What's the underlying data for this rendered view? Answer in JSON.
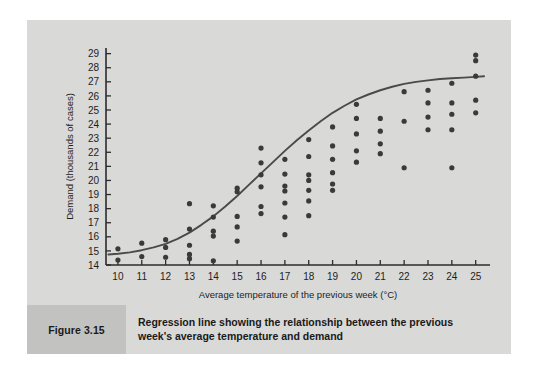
{
  "figure": {
    "number_label": "Figure 3.15",
    "caption": "Regression line showing the relationship between the previous week's average temperature and demand"
  },
  "colors": {
    "page_background": "#ffffff",
    "panel_background": "#d9d9d7",
    "caption_band": "#c2c2c0",
    "point_color": "#3a3a3a",
    "line_color": "#4a4a4a",
    "axis_color": "#2b2b2b",
    "text_color": "#1a1a1a"
  },
  "chart_data": {
    "type": "scatter",
    "title": "",
    "xlabel": "Average temperature of the previous week (°C)",
    "ylabel": "Demand (thousands of cases)",
    "xlim": [
      9.5,
      25.6
    ],
    "ylim": [
      14,
      29.4
    ],
    "xticks": [
      10,
      11,
      12,
      13,
      14,
      15,
      16,
      17,
      18,
      19,
      20,
      21,
      22,
      23,
      24,
      25
    ],
    "yticks": [
      14,
      15,
      16,
      17,
      18,
      19,
      20,
      21,
      22,
      23,
      24,
      25,
      26,
      27,
      28,
      29
    ],
    "grid": false,
    "legend": false,
    "series": [
      {
        "name": "Observations",
        "type": "scatter",
        "points": [
          [
            10,
            15.15
          ],
          [
            10,
            14.35
          ],
          [
            11,
            15.55
          ],
          [
            11,
            14.6
          ],
          [
            12,
            15.8
          ],
          [
            12,
            15.25
          ],
          [
            12,
            14.55
          ],
          [
            13,
            18.35
          ],
          [
            13,
            16.55
          ],
          [
            13,
            15.4
          ],
          [
            13,
            14.75
          ],
          [
            13,
            14.45
          ],
          [
            14,
            18.2
          ],
          [
            14,
            17.4
          ],
          [
            14,
            16.4
          ],
          [
            14,
            16.05
          ],
          [
            14,
            14.3
          ],
          [
            15,
            19.45
          ],
          [
            15,
            19.2
          ],
          [
            15,
            17.45
          ],
          [
            15,
            16.7
          ],
          [
            15,
            15.7
          ],
          [
            16,
            22.3
          ],
          [
            16,
            21.25
          ],
          [
            16,
            20.4
          ],
          [
            16,
            19.55
          ],
          [
            16,
            18.15
          ],
          [
            16,
            17.65
          ],
          [
            17,
            21.5
          ],
          [
            17,
            20.45
          ],
          [
            17,
            19.6
          ],
          [
            17,
            19.25
          ],
          [
            17,
            18.4
          ],
          [
            17,
            17.4
          ],
          [
            17,
            16.15
          ],
          [
            18,
            22.9
          ],
          [
            18,
            21.7
          ],
          [
            18,
            20.4
          ],
          [
            18,
            20.0
          ],
          [
            18,
            19.3
          ],
          [
            18,
            18.55
          ],
          [
            18,
            17.5
          ],
          [
            19,
            23.8
          ],
          [
            19,
            22.45
          ],
          [
            19,
            21.5
          ],
          [
            19,
            20.55
          ],
          [
            19,
            19.75
          ],
          [
            19,
            19.3
          ],
          [
            20,
            25.4
          ],
          [
            20,
            24.4
          ],
          [
            20,
            23.3
          ],
          [
            20,
            22.1
          ],
          [
            20,
            21.3
          ],
          [
            21,
            24.4
          ],
          [
            21,
            23.5
          ],
          [
            21,
            22.6
          ],
          [
            21,
            21.9
          ],
          [
            22,
            26.3
          ],
          [
            22,
            24.2
          ],
          [
            22,
            20.9
          ],
          [
            23,
            26.4
          ],
          [
            23,
            25.5
          ],
          [
            23,
            24.5
          ],
          [
            23,
            23.6
          ],
          [
            24,
            26.9
          ],
          [
            24,
            25.5
          ],
          [
            24,
            24.7
          ],
          [
            24,
            23.6
          ],
          [
            24,
            20.9
          ],
          [
            25,
            28.9
          ],
          [
            25,
            28.5
          ],
          [
            25,
            27.4
          ],
          [
            25,
            25.7
          ],
          [
            25,
            24.8
          ]
        ]
      },
      {
        "name": "Regression line",
        "type": "line",
        "points": [
          [
            9.6,
            14.75
          ],
          [
            10,
            14.8
          ],
          [
            10.5,
            14.9
          ],
          [
            11,
            15.05
          ],
          [
            11.5,
            15.25
          ],
          [
            12,
            15.5
          ],
          [
            12.5,
            15.85
          ],
          [
            13,
            16.3
          ],
          [
            13.5,
            16.85
          ],
          [
            14,
            17.45
          ],
          [
            14.5,
            18.15
          ],
          [
            15,
            18.9
          ],
          [
            15.5,
            19.7
          ],
          [
            16,
            20.5
          ],
          [
            16.5,
            21.3
          ],
          [
            17,
            22.1
          ],
          [
            17.5,
            22.85
          ],
          [
            18,
            23.55
          ],
          [
            18.5,
            24.2
          ],
          [
            19,
            24.8
          ],
          [
            19.5,
            25.3
          ],
          [
            20,
            25.75
          ],
          [
            20.5,
            26.1
          ],
          [
            21,
            26.4
          ],
          [
            21.5,
            26.65
          ],
          [
            22,
            26.85
          ],
          [
            22.5,
            27.0
          ],
          [
            23,
            27.1
          ],
          [
            23.5,
            27.2
          ],
          [
            24,
            27.25
          ],
          [
            24.5,
            27.3
          ],
          [
            25,
            27.35
          ],
          [
            25.35,
            27.4
          ]
        ]
      }
    ]
  }
}
